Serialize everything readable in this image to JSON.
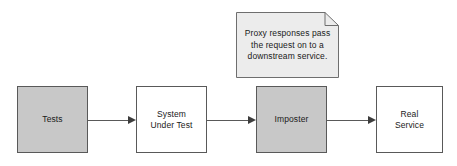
{
  "diagram": {
    "colors": {
      "node_fill_highlight": "#c8c8c8",
      "node_fill_plain": "#ffffff",
      "node_stroke": "#595959",
      "note_fill": "#ececec",
      "note_stroke": "#6e6e6e",
      "connector": "#595959",
      "text": "#1a1a1a",
      "background": "#ffffff"
    },
    "nodes": [
      {
        "id": "tests",
        "label": "Tests",
        "fill": "highlight"
      },
      {
        "id": "sut",
        "label": "System\nUnder Test",
        "fill": "plain"
      },
      {
        "id": "imposter",
        "label": "Imposter",
        "fill": "highlight"
      },
      {
        "id": "real",
        "label": "Real\nService",
        "fill": "plain"
      }
    ],
    "connectors": [
      {
        "id": "c1",
        "from": "tests",
        "to": "sut",
        "arrow": "right"
      },
      {
        "id": "c2",
        "from": "sut",
        "to": "imposter",
        "arrow": "right"
      },
      {
        "id": "c3",
        "from": "imposter",
        "to": "real",
        "arrow": "right"
      }
    ],
    "note": {
      "text": "Proxy responses pass\nthe request on to a\ndownstream service.",
      "attached_to": "imposter",
      "shape": "folded-corner-document"
    }
  }
}
